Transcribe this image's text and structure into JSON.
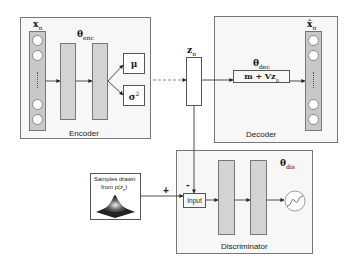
{
  "encoder": {
    "label": "Encoder",
    "input_label": "x",
    "input_sub": "n",
    "theta_label": "θ",
    "theta_sub": "enc",
    "mu_label": "μ",
    "sigma_label": "σ",
    "sigma_sup": "2"
  },
  "latent": {
    "label": "z",
    "sub": "n"
  },
  "decoder": {
    "label": "Decoder",
    "theta_label": "θ",
    "theta_sub": "dec",
    "formula": "m + Vz",
    "formula_sub": "n",
    "output_label": "x̂",
    "output_sub": "n"
  },
  "discriminator": {
    "label": "Discriminator",
    "theta_label": "θ",
    "theta_sub": "dis",
    "input_label": "Input",
    "minus_sign": "-",
    "plus_sign": "+"
  },
  "samples": {
    "line1": "Samples drawn",
    "line2": "from p(z",
    "line2_sub": "n",
    "line2_end": ")"
  }
}
